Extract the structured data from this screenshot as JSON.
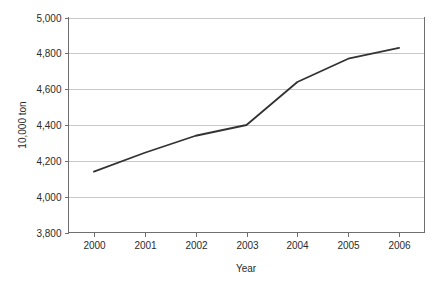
{
  "chart_data": {
    "type": "line",
    "title": "",
    "title_note": "title row is cropped off the top edge of the screenshot",
    "xlabel": "Year",
    "ylabel": "10,000 ton",
    "categories": [
      "2000",
      "2001",
      "2002",
      "2003",
      "2004",
      "2005",
      "2006"
    ],
    "values": [
      4140,
      4245,
      4340,
      4400,
      4640,
      4770,
      4830
    ],
    "series": [
      {
        "name": "",
        "values": [
          4140,
          4245,
          4340,
          4400,
          4640,
          4770,
          4830
        ]
      }
    ],
    "ylim": [
      3800,
      5000
    ],
    "ytick_values": [
      5000,
      4800,
      4600,
      4400,
      4200,
      4000,
      3800
    ],
    "ytick_labels": [
      "5,000",
      "4,800",
      "4,600",
      "4,400",
      "4,200",
      "4,000",
      "3,800"
    ],
    "xtick_labels": [
      "2000",
      "2001",
      "2002",
      "2003",
      "2004",
      "2005",
      "2006"
    ],
    "grid": "horizontal",
    "legend": "none",
    "line_color": "#333333",
    "grid_color": "#c8c8c8",
    "axis_color": "#6f6f6f",
    "background": "#ffffff",
    "markers": "none"
  }
}
